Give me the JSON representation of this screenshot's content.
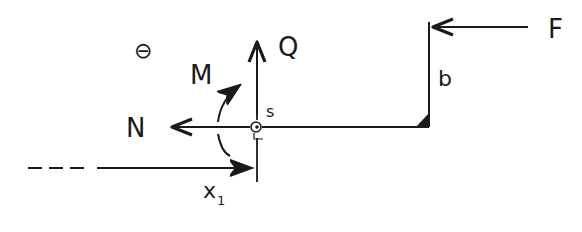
{
  "diagram": {
    "type": "free-body diagram (hand-drawn)",
    "stroke_color": "#1a1a1a",
    "labels": {
      "sign": "⊖",
      "moment": "M",
      "shear": "Q",
      "normal": "N",
      "section_point": "s",
      "force": "F",
      "arm_length": "b",
      "coordinate": "x",
      "coordinate_sub": "1"
    },
    "elements": [
      {
        "id": "beam-horizontal",
        "kind": "line",
        "from": "section s",
        "to": "corner"
      },
      {
        "id": "beam-vertical",
        "kind": "line",
        "from": "corner",
        "to": "top (force application)"
      },
      {
        "id": "force-F",
        "kind": "arrow",
        "direction": "left",
        "label": "F"
      },
      {
        "id": "normal-N",
        "kind": "arrow",
        "direction": "left",
        "label": "N"
      },
      {
        "id": "shear-Q",
        "kind": "arrow",
        "direction": "up",
        "label": "Q"
      },
      {
        "id": "moment-M",
        "kind": "curved-arrow",
        "direction": "counterclockwise",
        "label": "M"
      },
      {
        "id": "coordinate-x1",
        "kind": "dashed-to-solid arrow",
        "direction": "right",
        "label": "x1"
      },
      {
        "id": "rigid-corner",
        "kind": "filled triangle"
      }
    ]
  }
}
